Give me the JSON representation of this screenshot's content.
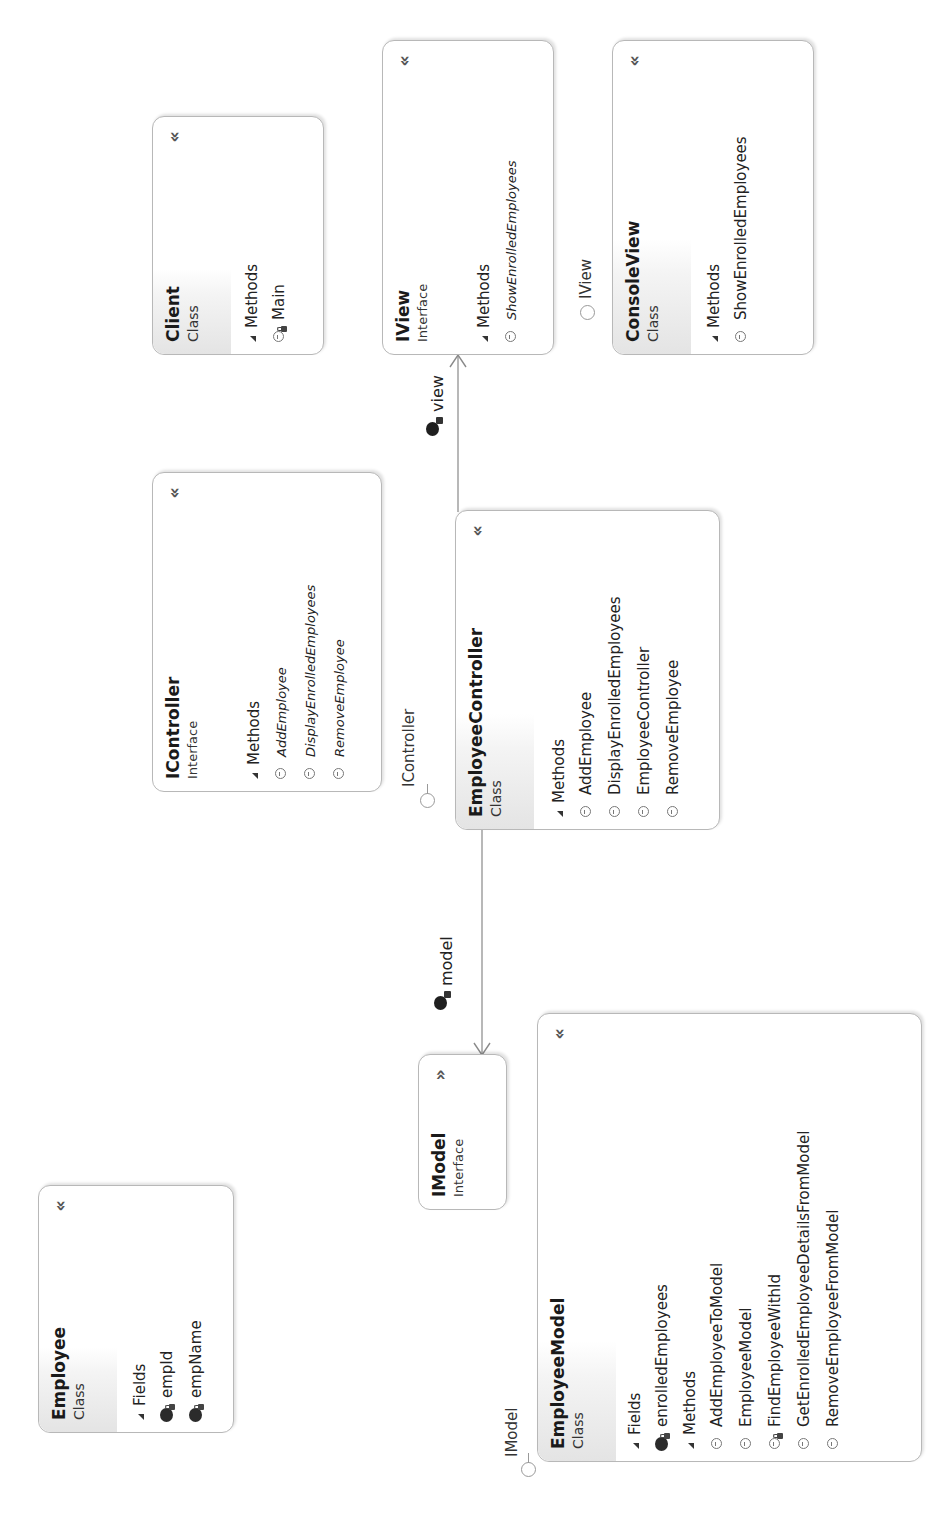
{
  "diagram": {
    "type": "class-diagram",
    "collapse_icon": "double-chevron-up",
    "expand_icon": "double-chevron-down",
    "classes": [
      {
        "id": "employee",
        "name": "Employee",
        "kind": "Class",
        "fields_label": "Fields",
        "fields": [
          {
            "name": "empId",
            "visibility": "private"
          },
          {
            "name": "empName",
            "visibility": "private"
          }
        ],
        "methods_label": "Methods",
        "methods": [
          {
            "name": "Employee",
            "visibility": "public"
          },
          {
            "name": "GetEmpId",
            "visibility": "public"
          },
          {
            "name": "GetEmpName",
            "visibility": "public"
          },
          {
            "name": "ToString",
            "visibility": "public"
          }
        ]
      },
      {
        "id": "imodel",
        "name": "IModel",
        "kind": "Interface",
        "collapsed": true
      },
      {
        "id": "employeemodel",
        "name": "EmployeeModel",
        "kind": "Class",
        "implements": "IModel",
        "fields_label": "Fields",
        "fields": [
          {
            "name": "enrolledEmployees",
            "visibility": "private"
          }
        ],
        "methods_label": "Methods",
        "methods": [
          {
            "name": "AddEmployeeToModel",
            "visibility": "public"
          },
          {
            "name": "EmployeeModel",
            "visibility": "public"
          },
          {
            "name": "FindEmployeeWithId",
            "visibility": "private"
          },
          {
            "name": "GetEnrolledEmployeeDetailsFromModel",
            "visibility": "public"
          },
          {
            "name": "RemoveEmployeeFromModel",
            "visibility": "public"
          }
        ]
      },
      {
        "id": "icontroller",
        "name": "IController",
        "kind": "Interface",
        "methods_label": "Methods",
        "methods": [
          {
            "name": "AddEmployee",
            "visibility": "public",
            "abstract": true
          },
          {
            "name": "DisplayEnrolledEmployees",
            "visibility": "public",
            "abstract": true
          },
          {
            "name": "RemoveEmployee",
            "visibility": "public",
            "abstract": true
          }
        ]
      },
      {
        "id": "employeecontroller",
        "name": "EmployeeController",
        "kind": "Class",
        "implements": "IController",
        "methods_label": "Methods",
        "methods": [
          {
            "name": "AddEmployee",
            "visibility": "public"
          },
          {
            "name": "DisplayEnrolledEmployees",
            "visibility": "public"
          },
          {
            "name": "EmployeeController",
            "visibility": "public"
          },
          {
            "name": "RemoveEmployee",
            "visibility": "public"
          }
        ]
      },
      {
        "id": "client",
        "name": "Client",
        "kind": "Class",
        "methods_label": "Methods",
        "methods": [
          {
            "name": "Main",
            "visibility": "private"
          }
        ]
      },
      {
        "id": "iview",
        "name": "IView",
        "kind": "Interface",
        "methods_label": "Methods",
        "methods": [
          {
            "name": "ShowEnrolledEmployees",
            "visibility": "public",
            "abstract": true
          }
        ]
      },
      {
        "id": "consoleview",
        "name": "ConsoleView",
        "kind": "Class",
        "implements": "IView",
        "methods_label": "Methods",
        "methods": [
          {
            "name": "ShowEnrolledEmployees",
            "visibility": "public"
          }
        ]
      }
    ],
    "associations": [
      {
        "from": "EmployeeController",
        "to": "IModel",
        "label": "model"
      },
      {
        "from": "EmployeeController",
        "to": "IView",
        "label": "view"
      }
    ],
    "lollipops": [
      {
        "on": "EmployeeModel",
        "label": "IModel"
      },
      {
        "on": "EmployeeController",
        "label": "IController"
      },
      {
        "on": "ConsoleView",
        "label": "IView"
      }
    ]
  }
}
